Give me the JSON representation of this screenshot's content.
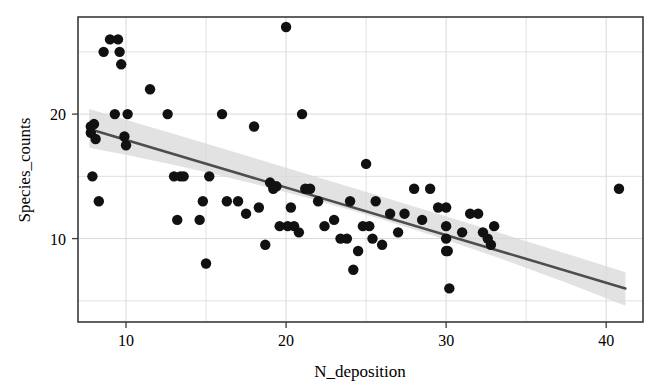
{
  "chart_data": {
    "type": "scatter",
    "title": "",
    "xlabel": "N_deposition",
    "ylabel": "Species_counts",
    "xlim": [
      7.0,
      42.3
    ],
    "ylim": [
      3.3,
      27.8
    ],
    "xticks": [
      10,
      20,
      30,
      40
    ],
    "xtick_labels": [
      "10",
      "20",
      "30",
      "40"
    ],
    "yticks": [
      10,
      20
    ],
    "ytick_labels": [
      "10",
      "20"
    ],
    "x_minor_gridlines": [
      5,
      15,
      25,
      35
    ],
    "y_minor_gridlines": [
      5,
      15,
      25
    ],
    "grid": true,
    "grid_color": "#d9d9d9",
    "frame_color": "#3a3a3a",
    "point_color": "#111111",
    "point_size": 5.2,
    "legend": "none",
    "series": [
      {
        "name": "observations",
        "x": [
          7.8,
          7.8,
          7.9,
          8.0,
          8.1,
          8.3,
          8.6,
          9.0,
          9.3,
          9.5,
          9.6,
          9.7,
          9.9,
          10.0,
          10.1,
          11.5,
          12.6,
          13.0,
          13.2,
          13.4,
          13.6,
          14.6,
          14.8,
          15.0,
          15.2,
          16.0,
          16.3,
          17.0,
          17.5,
          18.0,
          18.3,
          18.7,
          19.0,
          19.2,
          19.4,
          19.6,
          20.0,
          20.1,
          20.3,
          20.5,
          20.8,
          21.0,
          21.2,
          21.5,
          22.0,
          22.4,
          23.0,
          23.4,
          23.8,
          24.0,
          24.2,
          24.5,
          24.8,
          25.0,
          25.2,
          25.4,
          25.6,
          26.0,
          26.5,
          27.0,
          27.4,
          28.0,
          28.5,
          29.0,
          29.5,
          30.0,
          30.0,
          30.0,
          30.0,
          30.1,
          30.2,
          31.0,
          31.5,
          32.0,
          32.3,
          32.6,
          32.8,
          33.0,
          40.8
        ],
        "y": [
          19.0,
          18.5,
          15.0,
          19.2,
          18.0,
          13.0,
          25.0,
          26.0,
          20.0,
          26.0,
          25.0,
          24.0,
          18.2,
          17.5,
          20.0,
          22.0,
          20.0,
          15.0,
          11.5,
          15.0,
          15.0,
          11.5,
          13.0,
          8.0,
          15.0,
          20.0,
          13.0,
          13.0,
          12.0,
          19.0,
          12.5,
          9.5,
          14.5,
          14.0,
          14.2,
          11.0,
          27.0,
          11.0,
          12.5,
          11.0,
          10.5,
          20.0,
          14.0,
          14.0,
          13.0,
          11.0,
          11.5,
          10.0,
          10.0,
          13.0,
          7.5,
          9.0,
          11.0,
          16.0,
          11.0,
          10.0,
          13.0,
          9.5,
          12.0,
          10.5,
          12.0,
          14.0,
          11.5,
          14.0,
          12.5,
          12.5,
          11.0,
          10.0,
          9.0,
          9.0,
          6.0,
          10.5,
          12.0,
          12.0,
          10.5,
          10.0,
          9.5,
          11.0,
          14.0
        ]
      }
    ],
    "regression": {
      "type": "linear-fit",
      "line_color": "#4d4d4d",
      "line_width": 2.6,
      "x_start": 7.7,
      "x_end": 41.2,
      "y_start": 18.8,
      "y_end": 6.0,
      "band": {
        "fill": "#d8d8d8",
        "opacity": 0.75,
        "upper_start": 20.4,
        "lower_start": 17.3,
        "upper_mid": 14.1,
        "lower_mid": 13.3,
        "upper_end": 7.3,
        "lower_end": 4.6
      }
    }
  }
}
